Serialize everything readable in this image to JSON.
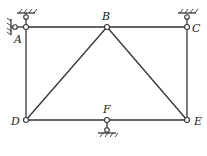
{
  "diagram": {
    "type": "truss",
    "nodes": {
      "A": {
        "label": "A",
        "x": 26,
        "y": 27
      },
      "B": {
        "label": "B",
        "x": 107,
        "y": 27
      },
      "C": {
        "label": "C",
        "x": 187,
        "y": 27
      },
      "D": {
        "label": "D",
        "x": 26,
        "y": 120
      },
      "F": {
        "label": "F",
        "x": 107,
        "y": 120
      },
      "E": {
        "label": "E",
        "x": 187,
        "y": 120
      }
    },
    "members": [
      [
        "A",
        "B"
      ],
      [
        "B",
        "C"
      ],
      [
        "A",
        "D"
      ],
      [
        "C",
        "E"
      ],
      [
        "D",
        "F"
      ],
      [
        "F",
        "E"
      ],
      [
        "B",
        "D"
      ],
      [
        "B",
        "E"
      ]
    ],
    "supports": [
      {
        "node": "A",
        "side": "top"
      },
      {
        "node": "A",
        "side": "left"
      },
      {
        "node": "C",
        "side": "top"
      },
      {
        "node": "F",
        "side": "bottom"
      }
    ],
    "colors": {
      "line": "#333333",
      "background": "#ffffff"
    }
  }
}
